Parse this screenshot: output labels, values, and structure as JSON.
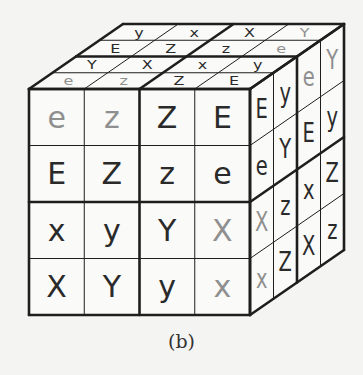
{
  "caption": "(b)",
  "colors": {
    "background": "#f4f4f2",
    "line": "#1e1e1e",
    "letter_dark": "#2a2a2a",
    "letter_gray": "#8f8f8f"
  },
  "geometry": {
    "front_origin": [
      29,
      89
    ],
    "cell_w": 55.25,
    "cell_h": 56.5,
    "depth_step": [
      23.5,
      -16.25
    ],
    "grid": 4
  },
  "cube": {
    "front_face": {
      "rows": [
        [
          {
            "t": "e",
            "g": 1
          },
          {
            "t": "z",
            "g": 1
          },
          {
            "t": "Z",
            "g": 0
          },
          {
            "t": "E",
            "g": 0
          }
        ],
        [
          {
            "t": "E",
            "g": 0
          },
          {
            "t": "Z",
            "g": 0
          },
          {
            "t": "z",
            "g": 0
          },
          {
            "t": "e",
            "g": 0
          }
        ],
        [
          {
            "t": "x",
            "g": 0
          },
          {
            "t": "y",
            "g": 0
          },
          {
            "t": "Y",
            "g": 0
          },
          {
            "t": "X",
            "g": 1
          }
        ],
        [
          {
            "t": "X",
            "g": 0
          },
          {
            "t": "Y",
            "g": 0
          },
          {
            "t": "y",
            "g": 0
          },
          {
            "t": "x",
            "g": 1
          }
        ]
      ]
    },
    "top_face": {
      "rows_back_to_front": [
        [
          {
            "t": "y",
            "g": 0
          },
          {
            "t": "x",
            "g": 0
          },
          {
            "t": "X",
            "g": 0
          },
          {
            "t": "Y",
            "g": 1
          }
        ],
        [
          {
            "t": "E",
            "g": 0
          },
          {
            "t": "Z",
            "g": 0
          },
          {
            "t": "z",
            "g": 0
          },
          {
            "t": "e",
            "g": 1
          }
        ],
        [
          {
            "t": "Y",
            "g": 0
          },
          {
            "t": "X",
            "g": 0
          },
          {
            "t": "x",
            "g": 0
          },
          {
            "t": "y",
            "g": 0
          }
        ],
        [
          {
            "t": "e",
            "g": 1
          },
          {
            "t": "z",
            "g": 1
          },
          {
            "t": "Z",
            "g": 0
          },
          {
            "t": "E",
            "g": 0
          }
        ]
      ]
    },
    "right_face": {
      "rows_top_to_bottom_cols_front_to_back": [
        [
          {
            "t": "E",
            "g": 0
          },
          {
            "t": "y",
            "g": 0
          },
          {
            "t": "e",
            "g": 1
          },
          {
            "t": "Y",
            "g": 1
          }
        ],
        [
          {
            "t": "e",
            "g": 0
          },
          {
            "t": "Y",
            "g": 0
          },
          {
            "t": "E",
            "g": 0
          },
          {
            "t": "y",
            "g": 0
          }
        ],
        [
          {
            "t": "X",
            "g": 1
          },
          {
            "t": "z",
            "g": 0
          },
          {
            "t": "x",
            "g": 0
          },
          {
            "t": "Z",
            "g": 0
          }
        ],
        [
          {
            "t": "x",
            "g": 1
          },
          {
            "t": "Z",
            "g": 0
          },
          {
            "t": "X",
            "g": 0
          },
          {
            "t": "z",
            "g": 0
          }
        ]
      ]
    }
  }
}
